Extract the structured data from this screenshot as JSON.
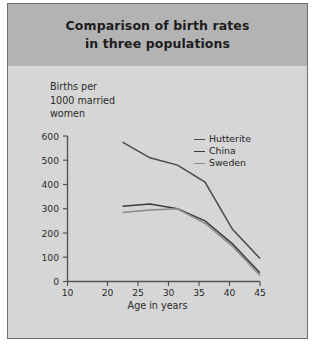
{
  "figure": {
    "title_line1": "Comparison of birth rates",
    "title_line2": "in three populations",
    "border_color": "#6e6e6e",
    "header_bg": "#b3b3b3",
    "body_bg": "#d6d6d6"
  },
  "axis_title_lines": {
    "line1": "Births per",
    "line2": "1000 married",
    "line3": "women"
  },
  "legend": {
    "items": [
      {
        "label": "Hutterite",
        "color": "#4a4a4a"
      },
      {
        "label": "China",
        "color": "#3b3b3b"
      },
      {
        "label": "Sweden",
        "color": "#8a8a8a"
      }
    ]
  },
  "chart_data": {
    "type": "line",
    "title": "Comparison of birth rates in three populations",
    "xlabel": "Age in years",
    "ylabel": "Births per 1000 married women",
    "x": [
      20,
      25,
      30,
      35,
      40,
      45
    ],
    "xticks": [
      10,
      20,
      25,
      30,
      35,
      40,
      45
    ],
    "xtick_labels": [
      "10",
      "20",
      "25",
      "30",
      "35",
      "40",
      "45"
    ],
    "yticks": [
      0,
      100,
      200,
      300,
      400,
      500,
      600
    ],
    "ytick_labels": [
      "0",
      "100",
      "200",
      "300",
      "400",
      "500",
      "600"
    ],
    "xlim": [
      10,
      45
    ],
    "ylim": [
      0,
      600
    ],
    "grid": false,
    "legend_position": "upper right",
    "series": [
      {
        "name": "Hutterite",
        "color": "#4a4a4a",
        "values": [
          575,
          510,
          480,
          410,
          215,
          95
        ]
      },
      {
        "name": "China",
        "color": "#3b3b3b",
        "values": [
          310,
          320,
          300,
          250,
          155,
          35
        ]
      },
      {
        "name": "Sweden",
        "color": "#8a8a8a",
        "values": [
          285,
          295,
          300,
          240,
          145,
          25
        ]
      }
    ]
  }
}
